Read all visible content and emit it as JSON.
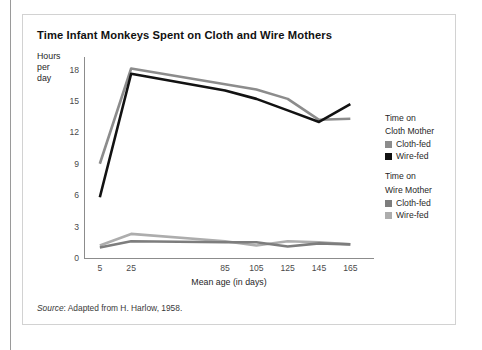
{
  "chart_data": {
    "type": "line",
    "title": "Time Infant Monkeys Spent on Cloth and Wire Mothers",
    "xlabel": "Mean age (in days)",
    "ylabel": "Hours per day",
    "ylabel_lines": [
      "Hours",
      "per",
      "day"
    ],
    "x": [
      5,
      25,
      85,
      105,
      125,
      145,
      165
    ],
    "xtick_labels": [
      "5",
      "25",
      "85",
      "105",
      "125",
      "145",
      "165"
    ],
    "ytick_labels": [
      "0",
      "3",
      "6",
      "9",
      "12",
      "15",
      "18"
    ],
    "ytick_values": [
      0,
      3,
      6,
      9,
      12,
      15,
      18
    ],
    "ylim": [
      0,
      19.2
    ],
    "grid": false,
    "legend_position": "right",
    "series": [
      {
        "name": "Time on Cloth Mother — Cloth-fed",
        "group": "Time on Cloth Mother",
        "label": "Cloth-fed",
        "color": "#8c8c8c",
        "values": [
          9.0,
          18.1,
          16.6,
          16.1,
          15.2,
          13.2,
          13.3
        ]
      },
      {
        "name": "Time on Cloth Mother — Wire-fed",
        "group": "Time on Cloth Mother",
        "label": "Wire-fed",
        "color": "#121212",
        "values": [
          5.8,
          17.6,
          16.0,
          15.2,
          14.1,
          13.0,
          14.7
        ]
      },
      {
        "name": "Time on Wire Mother — Cloth-fed",
        "group": "Time on Wire Mother",
        "label": "Cloth-fed",
        "color": "#7d7d7d",
        "values": [
          1.0,
          1.6,
          1.5,
          1.5,
          1.1,
          1.4,
          1.3
        ]
      },
      {
        "name": "Time on Wire Mother — Wire-fed",
        "group": "Time on Wire Mother",
        "label": "Wire-fed",
        "color": "#adadad",
        "values": [
          1.2,
          2.3,
          1.6,
          1.2,
          1.6,
          1.5,
          1.3
        ]
      }
    ],
    "annotations": []
  },
  "legend": {
    "groups": [
      {
        "heading_lines": [
          "Time on",
          "Cloth Mother"
        ],
        "entries": [
          {
            "label": "Cloth-fed",
            "color": "#8c8c8c"
          },
          {
            "label": "Wire-fed",
            "color": "#121212"
          }
        ]
      },
      {
        "heading_lines": [
          "Time on",
          "Wire Mother"
        ],
        "entries": [
          {
            "label": "Cloth-fed",
            "color": "#7d7d7d"
          },
          {
            "label": "Wire-fed",
            "color": "#adadad"
          }
        ]
      }
    ]
  },
  "source": {
    "prefix": "Source",
    "text": ": Adapted from H. Harlow, 1958."
  }
}
